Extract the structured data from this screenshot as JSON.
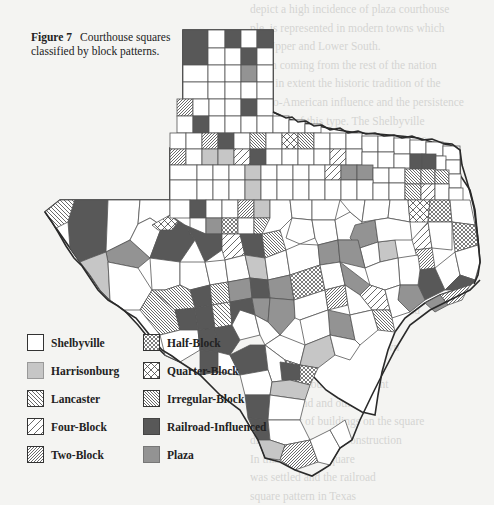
{
  "figure": {
    "label": "Figure 7",
    "caption": "Courthouse squares classified by block patterns."
  },
  "legend": {
    "items": [
      {
        "key": "shelbyville",
        "label": "Shelbyville",
        "pattern": "blank",
        "fill": "#ffffff"
      },
      {
        "key": "harrisonburg",
        "label": "Harrisonburg",
        "pattern": "light-gray",
        "fill": "#c6c6c6"
      },
      {
        "key": "lancaster",
        "label": "Lancaster",
        "pattern": "hatch-backslash",
        "fill": "#ffffff"
      },
      {
        "key": "four-block",
        "label": "Four-Block",
        "pattern": "sparse-hatch-slash",
        "fill": "#ffffff"
      },
      {
        "key": "two-block",
        "label": "Two-Block",
        "pattern": "dense-hatch-slash",
        "fill": "#ffffff"
      },
      {
        "key": "half-block",
        "label": "Half-Block",
        "pattern": "dense-crosshatch",
        "fill": "#ffffff"
      },
      {
        "key": "quarter-block",
        "label": "Quarter-Block",
        "pattern": "sparse-crosshatch",
        "fill": "#ffffff"
      },
      {
        "key": "irregular-block",
        "label": "Irregular-Block",
        "pattern": "dense-hatch-backslash",
        "fill": "#ffffff"
      },
      {
        "key": "railroad-influenced",
        "label": "Railroad-Influenced",
        "pattern": "dark-gray",
        "fill": "#585858"
      },
      {
        "key": "plaza",
        "label": "Plaza",
        "pattern": "mid-gray",
        "fill": "#939393"
      }
    ]
  },
  "colors": {
    "page": "#f4f4f2",
    "outline": "#2a2a2a",
    "county_line": "#555555"
  },
  "bleed_text_upper": [
    "depict a high incidence of plaza courthouse",
    "ple, is represented in modern towns which",
    "the Upper and Lower South.",
    "ration coming from the rest of the nation",
    "went in extent the historic tradition of the",
    "Anglo-American influence and the persistence",
    "diffusion of this type. The Shelbyville",
    "characterized the eastern half of Texas"
  ],
  "bleed_text_lower": [
    "than most western states, the",
    "square type was common in Texas, and",
    "the courthouse square as it was planned",
    "as a model of county-seat design and",
    "became the standard in that the",
    "most important ones of the town",
    "the squares have been altered",
    "by the courthouse's placement",
    "grants of land and other",
    "the number of buildings on the square",
    "direction of railroad construction",
    "In this book the square",
    "was settled and the railroad",
    "square pattern in Texas"
  ]
}
